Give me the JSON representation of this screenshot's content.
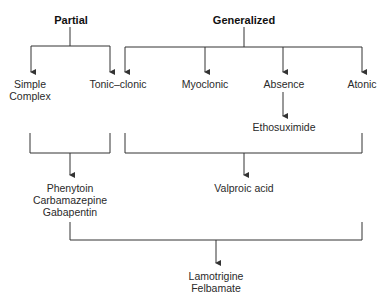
{
  "diagram": {
    "categories": {
      "partial": "Partial",
      "generalized": "Generalized"
    },
    "seizure_types": {
      "simple": "Simple",
      "complex": "Complex",
      "tonic_clonic": "Tonic–clonic",
      "myoclonic": "Myoclonic",
      "absence": "Absence",
      "atonic": "Atonic"
    },
    "drugs": {
      "ethosuximide": "Ethosuximide",
      "partial_drugs": [
        "Phenytoin",
        "Carbamazepine",
        "Gabapentin"
      ],
      "valproic_acid": "Valproic acid",
      "broad_drugs": [
        "Lamotrigine",
        "Felbamate"
      ]
    },
    "colors": {
      "line": "#333333",
      "text": "#2a2a2a"
    }
  }
}
